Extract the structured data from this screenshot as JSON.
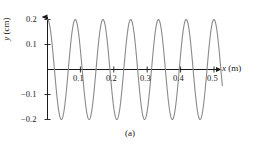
{
  "figure": {
    "caption": "(a)",
    "background_color": "#ffffff"
  },
  "axes": {
    "x_title_var": "x",
    "x_title_unit": " (m)",
    "y_title_var": "y",
    "y_title_unit": " (cm)",
    "axis_color": "#1a1a1a",
    "curve_color": "#8a8a8a"
  },
  "ticks": {
    "x": [
      {
        "value": 0.1,
        "label": "0.1"
      },
      {
        "value": 0.2,
        "label": "0.2"
      },
      {
        "value": 0.3,
        "label": "0.3"
      },
      {
        "value": 0.4,
        "label": "0.4"
      },
      {
        "value": 0.5,
        "label": "0.5"
      }
    ],
    "y": [
      {
        "value": 0.2,
        "label": "0.2"
      },
      {
        "value": 0.1,
        "label": "0.1"
      },
      {
        "value": -0.1,
        "label": "−0.1"
      },
      {
        "value": -0.2,
        "label": "−0.2"
      }
    ]
  },
  "chart_data": {
    "type": "line",
    "title": "(a)",
    "xlabel": "x (m)",
    "ylabel": "y (cm)",
    "xlim": [
      0,
      0.525
    ],
    "ylim": [
      -0.2,
      0.2
    ],
    "grid": false,
    "legend": null,
    "xticks": [
      0.1,
      0.2,
      0.3,
      0.4,
      0.5
    ],
    "yticks": [
      -0.2,
      -0.1,
      0.1,
      0.2
    ],
    "series": [
      {
        "name": "snapshot of wave",
        "form": "y = A cos(2*pi*x/lambda)",
        "amplitude_cm": 0.2,
        "wavelength_m": 0.0833,
        "cycles_shown": 6.3,
        "phase_deg": 0,
        "x": [
          0.0,
          0.0104,
          0.0208,
          0.0313,
          0.0417,
          0.0521,
          0.0625,
          0.0729,
          0.0833,
          0.0938,
          0.1042,
          0.1146,
          0.125,
          0.1354,
          0.1458,
          0.1563,
          0.1667,
          0.1771,
          0.1875,
          0.1979,
          0.2083,
          0.2188,
          0.2292,
          0.2396,
          0.25,
          0.2604,
          0.2708,
          0.2813,
          0.2917,
          0.3021,
          0.3125,
          0.3229,
          0.3333,
          0.3438,
          0.3542,
          0.3646,
          0.375,
          0.3854,
          0.3958,
          0.4063,
          0.4167,
          0.4271,
          0.4375,
          0.4479,
          0.4583,
          0.4688,
          0.4792,
          0.4896,
          0.5,
          0.5104,
          0.5208
        ],
        "y": [
          0.2,
          0.1848,
          0.1414,
          0.0765,
          0.0,
          -0.0765,
          -0.1414,
          -0.1848,
          -0.2,
          -0.1848,
          -0.1414,
          -0.0765,
          0.0,
          0.0765,
          0.1414,
          0.1848,
          0.2,
          0.1848,
          0.1414,
          0.0765,
          0.0,
          -0.0765,
          -0.1414,
          -0.1848,
          -0.2,
          -0.1848,
          -0.1414,
          -0.0765,
          0.0,
          0.0765,
          0.1414,
          0.1848,
          0.2,
          0.1848,
          0.1414,
          0.0765,
          0.0,
          -0.0765,
          -0.1414,
          -0.1848,
          -0.2,
          -0.1848,
          -0.1414,
          -0.0765,
          0.0,
          0.0765,
          0.1414,
          0.1848,
          0.2,
          0.1848,
          0.1414
        ]
      }
    ]
  }
}
